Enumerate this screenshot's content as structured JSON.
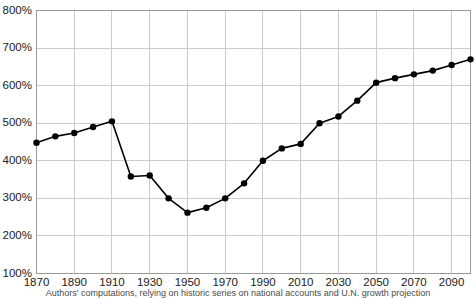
{
  "chart_data": {
    "type": "line",
    "title": "",
    "subtitle": "",
    "xlabel": "",
    "ylabel": "",
    "caption": "Authors' computations, relying on historic series on national accounts and U.N. growth projection",
    "grid": true,
    "legend": false,
    "marker": "filled-circle",
    "line_color": "#000000",
    "marker_color": "#000000",
    "grid_color": "#cccccc",
    "axis_color": "#999999",
    "background": "#ffffff",
    "xlim": [
      1870,
      2100
    ],
    "ylim": [
      100,
      800
    ],
    "ytick_labels": [
      "100%",
      "200%",
      "300%",
      "400%",
      "500%",
      "600%",
      "700%",
      "800%"
    ],
    "ytick_values": [
      100,
      200,
      300,
      400,
      500,
      600,
      700,
      800
    ],
    "xtick_labels": [
      "1870",
      "1890",
      "1910",
      "1930",
      "1950",
      "1970",
      "1990",
      "2010",
      "2030",
      "2050",
      "2070",
      "2090"
    ],
    "xtick_values": [
      1870,
      1890,
      1910,
      1930,
      1950,
      1970,
      1990,
      2010,
      2030,
      2050,
      2070,
      2090
    ],
    "x": [
      1870,
      1880,
      1890,
      1900,
      1910,
      1920,
      1930,
      1940,
      1950,
      1960,
      1970,
      1980,
      1990,
      2000,
      2010,
      2020,
      2030,
      2040,
      2050,
      2060,
      2070,
      2080,
      2090,
      2100
    ],
    "values": [
      448,
      465,
      474,
      490,
      505,
      358,
      361,
      300,
      262,
      275,
      300,
      340,
      400,
      433,
      445,
      500,
      518,
      560,
      608,
      620,
      630,
      640,
      655,
      670
    ],
    "series": [
      {
        "name": "Capital/income ratio",
        "values": [
          448,
          465,
          474,
          490,
          505,
          358,
          361,
          300,
          262,
          275,
          300,
          340,
          400,
          433,
          445,
          500,
          518,
          560,
          608,
          620,
          630,
          640,
          655,
          670
        ]
      }
    ]
  }
}
